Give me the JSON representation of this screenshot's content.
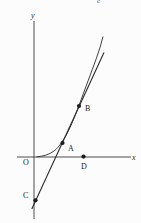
{
  "figure": {
    "background": "#fcfcfc",
    "ink_color": "#2b2b2b",
    "axis_color": "#3a3a3a",
    "partial_top_text": "c",
    "axes": {
      "y_label": "y",
      "x_label": "x",
      "origin_label": "O"
    },
    "points": [
      {
        "id": "A",
        "label": "A"
      },
      {
        "id": "B",
        "label": "B"
      },
      {
        "id": "C",
        "label": "C"
      },
      {
        "id": "D",
        "label": "D"
      }
    ]
  }
}
